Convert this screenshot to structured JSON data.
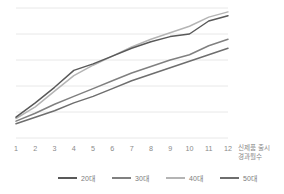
{
  "chart_data": {
    "type": "line",
    "title": "",
    "subtitle": "",
    "xlabel": "신제품 출시 경과월수",
    "xlabel_lines": [
      "신제품 출시",
      "경과월수"
    ],
    "ylabel": "",
    "x": [
      1,
      2,
      3,
      4,
      5,
      6,
      7,
      8,
      9,
      10,
      11,
      12
    ],
    "categories": [
      "1",
      "2",
      "3",
      "4",
      "5",
      "6",
      "7",
      "8",
      "9",
      "10",
      "11",
      "12"
    ],
    "xlim": [
      1,
      12
    ],
    "ylim": [
      0,
      100
    ],
    "grid": true,
    "gridlines_y": [
      20,
      40,
      60,
      80,
      100
    ],
    "y_axis_labels_visible": false,
    "legend_position": "bottom",
    "series": [
      {
        "name": "20대",
        "color": "#595959",
        "values": [
          16,
          27,
          39,
          52,
          57,
          63,
          69,
          74,
          78,
          80,
          90,
          94
        ]
      },
      {
        "name": "30대",
        "color": "#808080",
        "values": [
          13,
          19,
          26,
          32,
          38,
          44,
          50,
          55,
          60,
          64,
          71,
          76
        ]
      },
      {
        "name": "40대",
        "color": "#b4b4b4",
        "values": [
          15,
          24,
          36,
          48,
          56,
          63,
          70,
          76,
          81,
          86,
          93,
          97
        ]
      },
      {
        "name": "50대",
        "color": "#6e6e6e",
        "values": [
          11,
          16,
          21,
          27,
          32,
          38,
          44,
          49,
          54,
          59,
          64,
          69
        ]
      }
    ]
  },
  "legend": {
    "items": [
      {
        "label": "20대",
        "color": "#595959"
      },
      {
        "label": "30대",
        "color": "#808080"
      },
      {
        "label": "40대",
        "color": "#b4b4b4"
      },
      {
        "label": "50대",
        "color": "#6e6e6e"
      }
    ]
  },
  "axis": {
    "x_tick_labels": [
      "1",
      "2",
      "3",
      "4",
      "5",
      "6",
      "7",
      "8",
      "9",
      "10",
      "11",
      "12"
    ],
    "x_title_line1": "신제품 출시",
    "x_title_line2": "경과월수"
  },
  "colors": {
    "background": "#ffffff",
    "gridline": "#e2e2e2",
    "tick_text": "#8a8a8a",
    "legend_text": "#7c7c7c"
  }
}
